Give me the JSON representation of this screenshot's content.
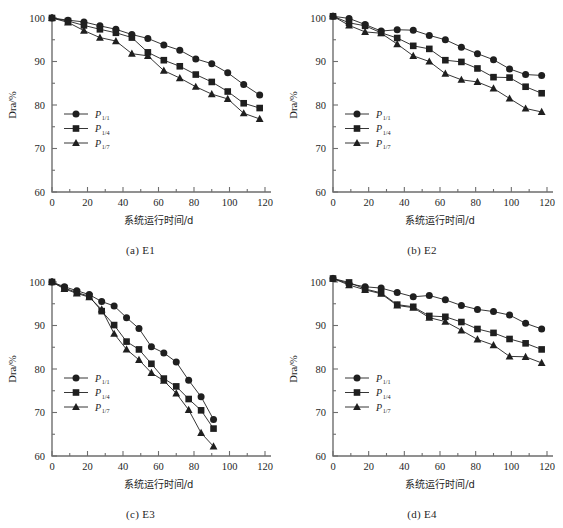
{
  "figure": {
    "background": "#ffffff",
    "ink": "#1f1f1f",
    "axis_color": "#6e6e6e"
  },
  "axes": {
    "xlabel": "系统运行时间/d",
    "ylabel": "Dra/%",
    "xlim": [
      0,
      120
    ],
    "ylim": [
      60,
      100
    ],
    "xticks": [
      0,
      20,
      40,
      60,
      80,
      100,
      120
    ],
    "yticks": [
      60,
      70,
      80,
      90,
      100
    ],
    "xminor_step": 10,
    "yminor_step": 5,
    "grid": false
  },
  "legend": {
    "position": "lower-left",
    "entries": [
      {
        "base": "P",
        "sub": "1/1",
        "marker": "circle"
      },
      {
        "base": "P",
        "sub": "1/4",
        "marker": "square"
      },
      {
        "base": "P",
        "sub": "1/7",
        "marker": "triangle"
      }
    ]
  },
  "panels": [
    {
      "key": "a",
      "caption": "(a) E1"
    },
    {
      "key": "b",
      "caption": "(b) E2"
    },
    {
      "key": "c",
      "caption": "(c) E3"
    },
    {
      "key": "d",
      "caption": "(d) E4"
    }
  ],
  "chart_data": [
    {
      "type": "line",
      "title": "(a) E1",
      "xlabel": "系统运行时间/d",
      "ylabel": "Dra/%",
      "xlim": [
        0,
        120
      ],
      "ylim": [
        60,
        100
      ],
      "xticks": [
        0,
        20,
        40,
        60,
        80,
        100,
        120
      ],
      "yticks": [
        60,
        70,
        80,
        90,
        100
      ],
      "grid": false,
      "legend_position": "lower-left",
      "x": [
        0,
        9,
        18,
        27,
        36,
        45,
        54,
        63,
        72,
        81,
        90,
        99,
        108,
        117
      ],
      "series": [
        {
          "name": "P1/1",
          "marker": "circle",
          "values": [
            100.0,
            99.5,
            99.1,
            98.2,
            97.4,
            96.2,
            95.3,
            93.8,
            92.6,
            90.6,
            89.5,
            87.4,
            84.7,
            82.3
          ]
        },
        {
          "name": "P1/4",
          "marker": "square",
          "values": [
            100.0,
            99.3,
            98.3,
            97.4,
            96.6,
            95.5,
            92.1,
            90.3,
            88.9,
            87.0,
            85.3,
            83.1,
            80.4,
            79.3
          ]
        },
        {
          "name": "P1/7",
          "marker": "triangle",
          "values": [
            100.0,
            99.0,
            97.1,
            95.5,
            94.7,
            91.8,
            91.3,
            87.9,
            86.2,
            84.2,
            82.5,
            81.4,
            78.1,
            76.8
          ]
        }
      ]
    },
    {
      "type": "line",
      "title": "(b) E2",
      "xlabel": "系统运行时间/d",
      "ylabel": "Dra/%",
      "xlim": [
        0,
        120
      ],
      "ylim": [
        60,
        100
      ],
      "xticks": [
        0,
        20,
        40,
        60,
        80,
        100,
        120
      ],
      "yticks": [
        60,
        70,
        80,
        90,
        100
      ],
      "grid": false,
      "legend_position": "lower-left",
      "x": [
        0,
        9,
        18,
        27,
        36,
        45,
        54,
        63,
        72,
        81,
        90,
        99,
        108,
        117
      ],
      "series": [
        {
          "name": "P1/1",
          "marker": "circle",
          "values": [
            100.4,
            99.9,
            98.5,
            97.0,
            97.3,
            97.2,
            96.0,
            95.0,
            93.3,
            91.8,
            90.4,
            88.3,
            87.0,
            86.8
          ]
        },
        {
          "name": "P1/4",
          "marker": "square",
          "values": [
            100.4,
            98.9,
            98.2,
            96.6,
            95.4,
            93.6,
            92.9,
            90.3,
            89.9,
            88.4,
            86.4,
            86.3,
            84.2,
            82.7
          ]
        },
        {
          "name": "P1/7",
          "marker": "triangle",
          "values": [
            100.4,
            98.3,
            96.8,
            96.5,
            94.0,
            91.3,
            90.0,
            87.2,
            85.8,
            85.3,
            83.8,
            81.5,
            79.2,
            78.4
          ]
        }
      ]
    },
    {
      "type": "line",
      "title": "(c) E3",
      "xlabel": "系统运行时间/d",
      "ylabel": "Dra/%",
      "xlim": [
        0,
        120
      ],
      "ylim": [
        60,
        100
      ],
      "xticks": [
        0,
        20,
        40,
        60,
        80,
        100,
        120
      ],
      "yticks": [
        60,
        70,
        80,
        90,
        100
      ],
      "grid": false,
      "legend_position": "lower-left",
      "x": [
        0,
        7,
        14,
        21,
        28,
        35,
        42,
        49,
        56,
        63,
        70,
        77,
        84,
        91
      ],
      "series": [
        {
          "name": "P1/1",
          "marker": "circle",
          "values": [
            100.0,
            98.9,
            98.0,
            97.1,
            95.5,
            94.5,
            91.8,
            89.3,
            85.1,
            83.7,
            81.6,
            77.4,
            73.6,
            68.4
          ]
        },
        {
          "name": "P1/4",
          "marker": "square",
          "values": [
            100.0,
            98.6,
            97.6,
            96.7,
            93.3,
            90.1,
            86.3,
            84.5,
            81.2,
            77.8,
            76.0,
            73.1,
            70.5,
            66.3
          ]
        },
        {
          "name": "P1/7",
          "marker": "triangle",
          "values": [
            100.0,
            98.4,
            97.4,
            96.5,
            93.7,
            88.1,
            84.5,
            82.1,
            79.1,
            77.3,
            74.4,
            70.6,
            65.3,
            62.2
          ]
        }
      ]
    },
    {
      "type": "line",
      "title": "(d) E4",
      "xlabel": "系统运行时间/d",
      "ylabel": "Dra/%",
      "xlim": [
        0,
        120
      ],
      "ylim": [
        60,
        100
      ],
      "xticks": [
        0,
        20,
        40,
        60,
        80,
        100,
        120
      ],
      "yticks": [
        60,
        70,
        80,
        90,
        100
      ],
      "grid": false,
      "legend_position": "lower-left",
      "x": [
        0,
        9,
        18,
        27,
        36,
        45,
        54,
        63,
        72,
        81,
        90,
        99,
        108,
        117
      ],
      "series": [
        {
          "name": "P1/1",
          "marker": "circle",
          "values": [
            100.8,
            99.6,
            98.9,
            98.6,
            97.6,
            96.6,
            96.9,
            95.9,
            94.6,
            93.7,
            93.2,
            92.4,
            90.5,
            89.2
          ]
        },
        {
          "name": "P1/4",
          "marker": "square",
          "values": [
            100.8,
            99.9,
            98.4,
            97.5,
            94.8,
            94.3,
            92.2,
            92.0,
            90.8,
            89.2,
            88.3,
            86.9,
            85.9,
            84.5
          ]
        },
        {
          "name": "P1/7",
          "marker": "triangle",
          "values": [
            100.8,
            99.3,
            98.2,
            97.3,
            94.6,
            94.1,
            91.8,
            90.9,
            88.9,
            86.8,
            85.5,
            82.9,
            82.8,
            81.4
          ]
        }
      ]
    }
  ]
}
